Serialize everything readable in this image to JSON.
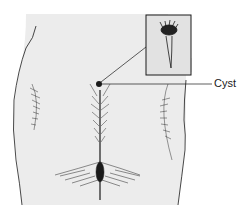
{
  "diagram": {
    "labels": [
      {
        "id": "cyst",
        "text": "Cyst"
      }
    ],
    "inset": {
      "depicts": "magnified cyst with hair tuft"
    },
    "colors": {
      "skin": "#ececec",
      "line": "#1a1a1a",
      "inset_bg": "#e2e2e2"
    }
  }
}
